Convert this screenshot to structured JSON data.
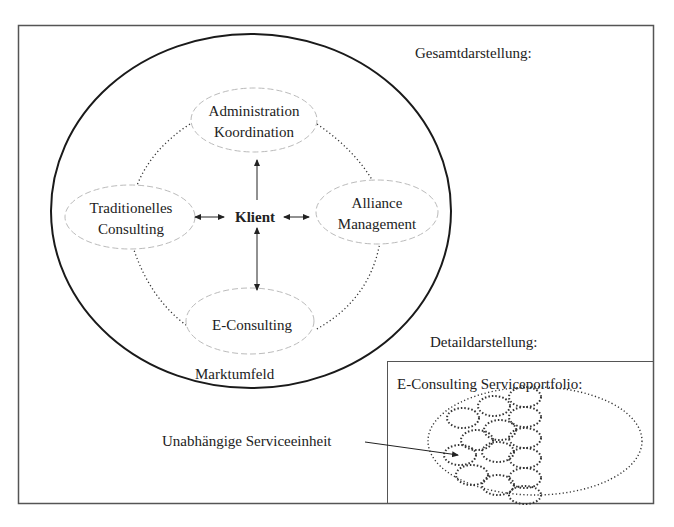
{
  "title": "Gesamtdarstellung:",
  "overview": {
    "center": "Klient",
    "environment": "Marktumfeld",
    "nodes": [
      {
        "id": "admin",
        "lines": [
          "Administration",
          "Koordination"
        ]
      },
      {
        "id": "traditional",
        "lines": [
          "Traditionelles",
          "Consulting"
        ]
      },
      {
        "id": "alliance",
        "lines": [
          "Alliance",
          "Management"
        ]
      },
      {
        "id": "econsulting",
        "lines": [
          "E-Consulting"
        ]
      }
    ]
  },
  "detail": {
    "heading": "Detaildarstellung:",
    "box_title": "E-Consulting Serviceportfolio:",
    "pointer_label": "Unabhängige Serviceeinheit"
  },
  "colors": {
    "frame": "#555555",
    "outer_circle": "#1a1a1a",
    "node_outline": "#bbbbbb",
    "dotted": "#333333",
    "text": "#222222"
  }
}
